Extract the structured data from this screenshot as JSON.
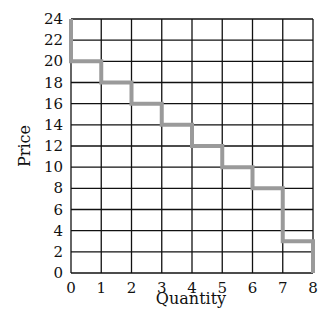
{
  "chart_data": {
    "type": "line",
    "subtype": "step",
    "title": "",
    "xlabel": "Quantity",
    "ylabel": "Price",
    "xlim": [
      0,
      8
    ],
    "ylim": [
      0,
      24
    ],
    "x_ticks": [
      0,
      1,
      2,
      3,
      4,
      5,
      6,
      7,
      8
    ],
    "y_ticks": [
      0,
      2,
      4,
      6,
      8,
      10,
      12,
      14,
      16,
      18,
      20,
      22,
      24
    ],
    "grid": true,
    "legend": null,
    "series": [
      {
        "name": "Demand",
        "color": "#9a9a9a",
        "points": [
          [
            0,
            24
          ],
          [
            0,
            20
          ],
          [
            1,
            20
          ],
          [
            1,
            18
          ],
          [
            2,
            18
          ],
          [
            2,
            16
          ],
          [
            3,
            16
          ],
          [
            3,
            14
          ],
          [
            4,
            14
          ],
          [
            4,
            12
          ],
          [
            5,
            12
          ],
          [
            5,
            10
          ],
          [
            6,
            10
          ],
          [
            6,
            8
          ],
          [
            7,
            8
          ],
          [
            7,
            3
          ],
          [
            8,
            3
          ],
          [
            8,
            0
          ]
        ],
        "steps": [
          {
            "quantity_range": [
              0,
              1
            ],
            "price": 20
          },
          {
            "quantity_range": [
              1,
              2
            ],
            "price": 18
          },
          {
            "quantity_range": [
              2,
              3
            ],
            "price": 16
          },
          {
            "quantity_range": [
              3,
              4
            ],
            "price": 14
          },
          {
            "quantity_range": [
              4,
              5
            ],
            "price": 12
          },
          {
            "quantity_range": [
              5,
              6
            ],
            "price": 10
          },
          {
            "quantity_range": [
              6,
              7
            ],
            "price": 8
          },
          {
            "quantity_range": [
              7,
              8
            ],
            "price": 3
          }
        ]
      }
    ]
  },
  "labels": {
    "xlabel": "Quantity",
    "ylabel": "Price"
  },
  "colors": {
    "grid": "#111111",
    "step_line": "#9a9a9a"
  }
}
